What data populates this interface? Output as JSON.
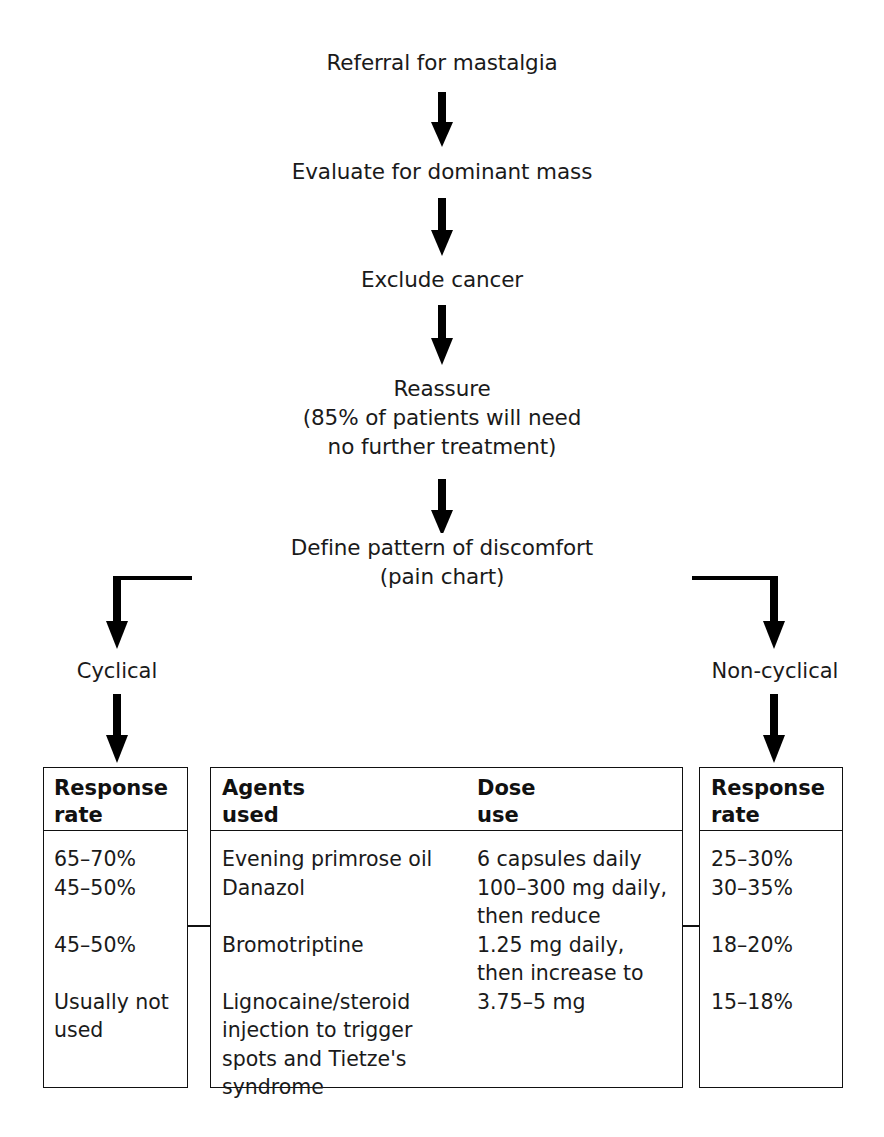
{
  "diagram": {
    "title_flow": "Mastalgia management algorithm",
    "nodes": [
      {
        "id": "referral",
        "text": "Referral for mastalgia"
      },
      {
        "id": "evaluate",
        "text": "Evaluate for dominant mass"
      },
      {
        "id": "exclude",
        "text": "Exclude cancer"
      },
      {
        "id": "reassure",
        "text": "Reassure\n(85% of patients will need\nno further treatment)"
      },
      {
        "id": "define",
        "text": "Define pattern of discomfort\n(pain chart)"
      }
    ],
    "branches": {
      "left_label": "Cyclical",
      "right_label": "Non-cyclical"
    },
    "left_box": {
      "header": "Response\nrate",
      "values": "65–70%\n45–50%\n\n45–50%\n\nUsually not\nused"
    },
    "middle_box": {
      "header_agents": "Agents\nused",
      "header_dose": "Dose\nuse",
      "agents": "Evening primrose oil\nDanazol\n\nBromotriptine\n\nLignocaine/steroid\ninjection to trigger\nspots and Tietze's\nsyndrome",
      "dose": "6 capsules daily\n100–300 mg daily,\n   then reduce\n1.25 mg daily,\n   then increase to\n3.75–5 mg"
    },
    "right_box": {
      "header": "Response\nrate",
      "values": "25–30%\n30–35%\n\n18–20%\n\n15–18%"
    },
    "colors": {
      "ink": "#111111",
      "text": "#1a1a1a",
      "background": "#ffffff"
    }
  }
}
